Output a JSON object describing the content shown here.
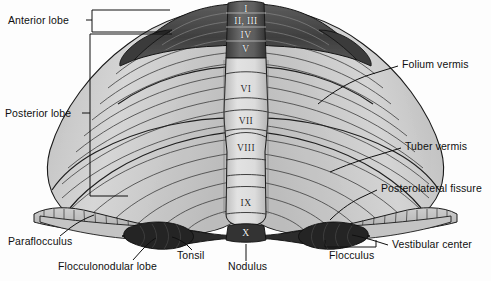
{
  "figure": {
    "background_color": "#fdfdfd",
    "ink_color": "#101010"
  },
  "palette": {
    "anterior_lobe_dark": "#4a4a4a",
    "posterior_lobe_light": "#c9c9c9",
    "vermis_light": "#d8d8d8",
    "flocculonodular_dark": "#2b2b2b",
    "outline": "#1a1a1a",
    "folia_line": "#3c3c3c"
  },
  "labels": {
    "left": [
      {
        "id": "anterior-lobe",
        "text": "Anterior lobe",
        "x": 8,
        "y": 15
      },
      {
        "id": "posterior-lobe",
        "text": "Posterior lobe",
        "x": 5,
        "y": 108
      }
    ],
    "right": [
      {
        "id": "folium-vermis",
        "text": "Folium vermis",
        "x": 402,
        "y": 64
      },
      {
        "id": "tuber-vermis",
        "text": "Tuber vermis",
        "x": 405,
        "y": 146
      },
      {
        "id": "posterolateral-fissure",
        "text": "Posterolateral fissure",
        "x": 381,
        "y": 187
      },
      {
        "id": "vestibular-center",
        "text": "Vestibular center",
        "x": 392,
        "y": 243
      }
    ],
    "bottom": [
      {
        "id": "paraflocculus",
        "text": "Paraflocculus",
        "x": 8,
        "y": 240
      },
      {
        "id": "flocculonodular-lobe",
        "text": "Flocculonodular lobe",
        "x": 58,
        "y": 265
      },
      {
        "id": "tonsil",
        "text": "Tonsil",
        "x": 177,
        "y": 254
      },
      {
        "id": "nodulus",
        "text": "Nodulus",
        "x": 228,
        "y": 265
      },
      {
        "id": "flocculus",
        "text": "Flocculus",
        "x": 329,
        "y": 254
      }
    ]
  },
  "vermis_lobules": [
    {
      "id": "lobule-I",
      "text": "I",
      "x": 252,
      "y": 6,
      "tone": "light"
    },
    {
      "id": "lobule-II-III",
      "text": "II, III",
      "x": 252,
      "y": 19,
      "tone": "light"
    },
    {
      "id": "lobule-IV",
      "text": "IV",
      "x": 252,
      "y": 33,
      "tone": "light"
    },
    {
      "id": "lobule-V",
      "text": "V",
      "x": 252,
      "y": 47,
      "tone": "light"
    },
    {
      "id": "lobule-VI",
      "text": "VI",
      "x": 252,
      "y": 87,
      "tone": "dark"
    },
    {
      "id": "lobule-VII",
      "text": "VII",
      "x": 252,
      "y": 119,
      "tone": "dark"
    },
    {
      "id": "lobule-VIII",
      "text": "VIII",
      "x": 252,
      "y": 146,
      "tone": "dark"
    },
    {
      "id": "lobule-IX",
      "text": "IX",
      "x": 252,
      "y": 201,
      "tone": "dark"
    },
    {
      "id": "lobule-X",
      "text": "X",
      "x": 252,
      "y": 231,
      "tone": "light"
    }
  ]
}
